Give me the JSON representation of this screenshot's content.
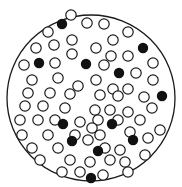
{
  "title": "",
  "figure": {
    "colors": {
      "stroke": "#1a1a1a",
      "filled": "#111111",
      "background": "#ffffff"
    },
    "open_circle_count": 68,
    "filled_circle_count": 12,
    "open_circles": [
      [
        71,
        15
      ],
      [
        104,
        24
      ],
      [
        87,
        23
      ],
      [
        128,
        32
      ],
      [
        48,
        32
      ],
      [
        113,
        40
      ],
      [
        72,
        40
      ],
      [
        54,
        45
      ],
      [
        36,
        48
      ],
      [
        96,
        48
      ],
      [
        72,
        54
      ],
      [
        111,
        56
      ],
      [
        128,
        56
      ],
      [
        24,
        65
      ],
      [
        55,
        63
      ],
      [
        104,
        65
      ],
      [
        153,
        63
      ],
      [
        136,
        73
      ],
      [
        32,
        80
      ],
      [
        58,
        78
      ],
      [
        78,
        86
      ],
      [
        96,
        80
      ],
      [
        153,
        80
      ],
      [
        113,
        89
      ],
      [
        128,
        89
      ],
      [
        144,
        97
      ],
      [
        28,
        93
      ],
      [
        50,
        93
      ],
      [
        70,
        94
      ],
      [
        100,
        95
      ],
      [
        118,
        96
      ],
      [
        25,
        106
      ],
      [
        43,
        106
      ],
      [
        65,
        108
      ],
      [
        95,
        110
      ],
      [
        110,
        110
      ],
      [
        128,
        112
      ],
      [
        152,
        108
      ],
      [
        20,
        120
      ],
      [
        38,
        120
      ],
      [
        55,
        120
      ],
      [
        80,
        122
      ],
      [
        98,
        120
      ],
      [
        118,
        120
      ],
      [
        140,
        120
      ],
      [
        22,
        135
      ],
      [
        48,
        135
      ],
      [
        75,
        135
      ],
      [
        92,
        128
      ],
      [
        130,
        132
      ],
      [
        148,
        138
      ],
      [
        32,
        148
      ],
      [
        58,
        148
      ],
      [
        88,
        140
      ],
      [
        105,
        148
      ],
      [
        120,
        150
      ],
      [
        145,
        155
      ],
      [
        70,
        160
      ],
      [
        90,
        162
      ],
      [
        110,
        160
      ],
      [
        125,
        162
      ],
      [
        62,
        172
      ],
      [
        80,
        172
      ],
      [
        103,
        175
      ],
      [
        128,
        172
      ],
      [
        40,
        160
      ],
      [
        160,
        130
      ],
      [
        100,
        135
      ]
    ],
    "filled_circles": [
      [
        62,
        24
      ],
      [
        143,
        48
      ],
      [
        39,
        63
      ],
      [
        86,
        64
      ],
      [
        119,
        73
      ],
      [
        162,
        96
      ],
      [
        63,
        124
      ],
      [
        112,
        124
      ],
      [
        72,
        141
      ],
      [
        98,
        151
      ],
      [
        91,
        178
      ],
      [
        133,
        140
      ]
    ]
  }
}
